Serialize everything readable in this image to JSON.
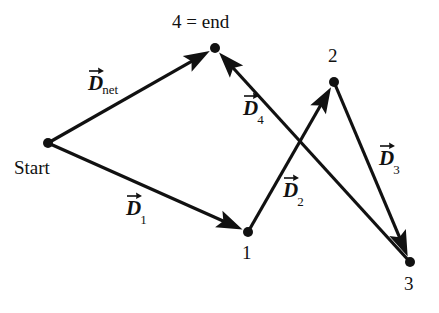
{
  "figure": {
    "background_color": "#ffffff",
    "stroke_color": "#111111",
    "width": 439,
    "height": 313
  },
  "nodes": [
    {
      "id": "start",
      "label": "Start",
      "x": 48,
      "y": 143,
      "label_x": 14,
      "label_y": 158
    },
    {
      "id": "n1",
      "label": "1",
      "x": 248,
      "y": 232,
      "label_x": 242,
      "label_y": 243
    },
    {
      "id": "n2",
      "label": "2",
      "x": 334,
      "y": 82,
      "label_x": 328,
      "label_y": 46
    },
    {
      "id": "n3",
      "label": "3",
      "x": 410,
      "y": 262,
      "label_x": 404,
      "label_y": 274
    },
    {
      "id": "n4",
      "label": "4 = end",
      "x": 215,
      "y": 48,
      "label_x": 172,
      "label_y": 12
    }
  ],
  "vectors": [
    {
      "id": "d-net",
      "name": "D_net",
      "symbol": "D",
      "subscript": "net",
      "from": "start",
      "to": "n4",
      "label_x": 88,
      "label_y": 73
    },
    {
      "id": "d-1",
      "name": "D_1",
      "symbol": "D",
      "subscript": "1",
      "from": "start",
      "to": "n1",
      "label_x": 126,
      "label_y": 198
    },
    {
      "id": "d-2",
      "name": "D_2",
      "symbol": "D",
      "subscript": "2",
      "from": "n1",
      "to": "n2",
      "label_x": 283,
      "label_y": 180
    },
    {
      "id": "d-3",
      "name": "D_3",
      "symbol": "D",
      "subscript": "3",
      "from": "n2",
      "to": "n3",
      "label_x": 379,
      "label_y": 148
    },
    {
      "id": "d-4",
      "name": "D_4",
      "symbol": "D",
      "subscript": "4",
      "from": "n3",
      "to": "n4",
      "label_x": 243,
      "label_y": 98
    }
  ],
  "chart_data": {
    "type": "diagram",
    "points": {
      "Start": [
        48,
        143
      ],
      "1": [
        248,
        232
      ],
      "2": [
        334,
        82
      ],
      "3": [
        410,
        262
      ],
      "4": [
        215,
        48
      ]
    },
    "arrows": [
      {
        "label": "D_net",
        "from": "Start",
        "to": "4"
      },
      {
        "label": "D_1",
        "from": "Start",
        "to": "1"
      },
      {
        "label": "D_2",
        "from": "1",
        "to": "2"
      },
      {
        "label": "D_3",
        "from": "2",
        "to": "3"
      },
      {
        "label": "D_4",
        "from": "3",
        "to": "4"
      }
    ],
    "legend": [],
    "xlabel": "",
    "ylabel": "",
    "grid": false
  }
}
